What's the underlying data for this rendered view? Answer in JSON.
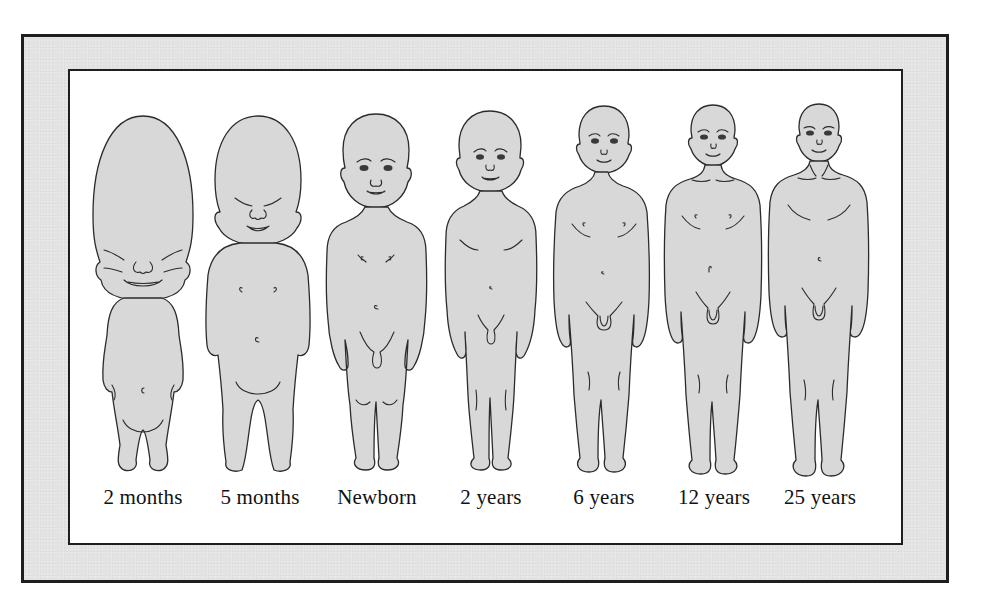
{
  "diagram": {
    "stages": [
      {
        "label": "2 months",
        "center_x": 143
      },
      {
        "label": "5 months",
        "center_x": 259
      },
      {
        "label": "Newborn",
        "center_x": 377
      },
      {
        "label": "2 years",
        "center_x": 491
      },
      {
        "label": "6 years",
        "center_x": 604
      },
      {
        "label": "12 years",
        "center_x": 714
      },
      {
        "label": "25 years",
        "center_x": 820
      }
    ],
    "colors": {
      "frame_band": "#e3e3e3",
      "border": "#1e1e1e",
      "panel": "#ffffff",
      "figure_fill": "#d8d8d8",
      "figure_outline": "#2b2b2b",
      "label_text": "#111111"
    }
  }
}
